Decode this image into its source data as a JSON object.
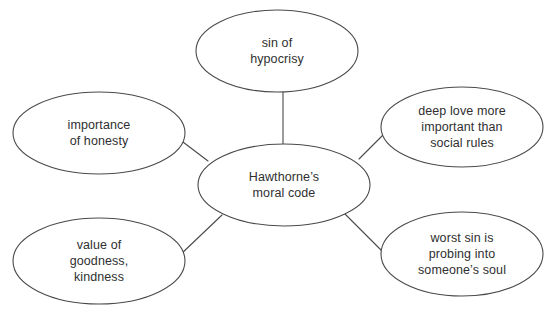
{
  "diagram": {
    "type": "concept-map",
    "background_color": "#ffffff",
    "stroke_color": "#4a4a4a",
    "text_color": "#2f2f2f",
    "center": {
      "id": "center",
      "label": "Hawthorne’s\nmoral code",
      "cx": 284,
      "cy": 185,
      "rx": 86,
      "ry": 41
    },
    "nodes": [
      {
        "id": "sin-of-hypocrisy",
        "label": "sin of\nhypocrisy",
        "cx": 277,
        "cy": 51,
        "rx": 81,
        "ry": 41
      },
      {
        "id": "importance-of-honesty",
        "label": "importance\nof honesty",
        "cx": 99,
        "cy": 133,
        "rx": 86,
        "ry": 41
      },
      {
        "id": "deep-love-more-important",
        "label": "deep love more\nimportant than\nsocial rules",
        "cx": 462,
        "cy": 127,
        "rx": 81,
        "ry": 40
      },
      {
        "id": "value-of-goodness-kindness",
        "label": "value of\ngoodness,\nkindness",
        "cx": 99,
        "cy": 261,
        "rx": 86,
        "ry": 43
      },
      {
        "id": "worst-sin-is-probing",
        "label": "worst sin is\nprobing into\nsomeone’s soul",
        "cx": 462,
        "cy": 254,
        "rx": 81,
        "ry": 42
      }
    ],
    "connectors": [
      {
        "id": "center-to-sin-of-hypocrisy",
        "from": "center",
        "to": "sin-of-hypocrisy",
        "x1": 283,
        "y1": 145,
        "x2": 283,
        "y2": 92
      },
      {
        "id": "center-to-importance-of-honesty",
        "from": "center",
        "to": "importance-of-honesty",
        "x1": 208,
        "y1": 161,
        "x2": 179,
        "y2": 139
      },
      {
        "id": "center-to-deep-love",
        "from": "center",
        "to": "deep-love-more-important",
        "x1": 359,
        "y1": 159,
        "x2": 386,
        "y2": 132
      },
      {
        "id": "center-to-value-of-goodness",
        "from": "center",
        "to": "value-of-goodness-kindness",
        "x1": 222,
        "y1": 215,
        "x2": 180,
        "y2": 255
      },
      {
        "id": "center-to-worst-sin",
        "from": "center",
        "to": "worst-sin-is-probing",
        "x1": 342,
        "y1": 211,
        "x2": 384,
        "y2": 253
      }
    ]
  }
}
